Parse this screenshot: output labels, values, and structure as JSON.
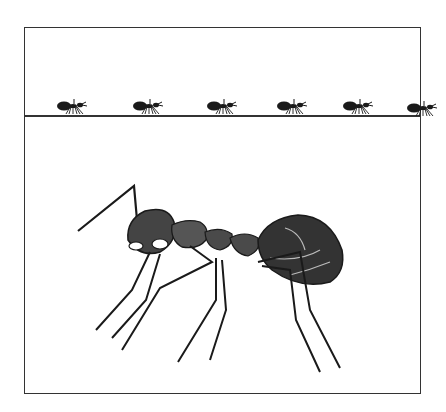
{
  "illustration": {
    "subject": "ant",
    "style": "black-and-white pen-and-ink engraving",
    "panels": {
      "top": {
        "description": "row of small silhouetted ants walking on a ground line",
        "ant_count": 6
      },
      "bottom": {
        "description": "large detailed side view of a single ant"
      }
    },
    "colors": {
      "ink": "#222222",
      "paper": "#ffffff",
      "frame": "#333333"
    }
  }
}
